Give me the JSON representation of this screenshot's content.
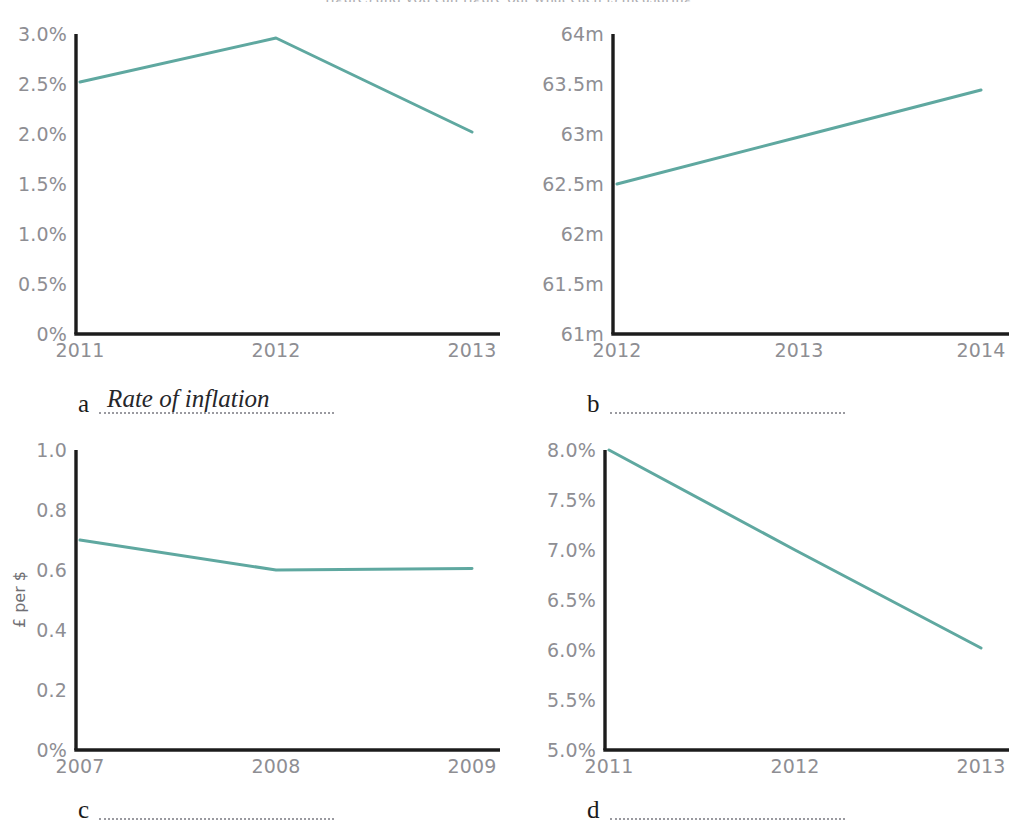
{
  "page": {
    "title_remnant": "figures and you can figure out what each is measuring",
    "line_color": "#5fa8a0",
    "axis_color": "#1c1c1c",
    "tick_label_color": "#8e8e93"
  },
  "charts": [
    {
      "key": "a",
      "letter": "a",
      "caption_answer": "Rate of inflation",
      "chart_data": {
        "type": "line",
        "title": "",
        "xlabel": "",
        "ylabel": "",
        "x": [
          "2011",
          "2012",
          "2013"
        ],
        "categories": [
          "2011",
          "2012",
          "2013"
        ],
        "values": [
          2.52,
          2.96,
          2.02
        ],
        "series": [
          {
            "name": "Rate of inflation",
            "values": [
              2.52,
              2.96,
              2.02
            ]
          }
        ],
        "ylim": [
          0,
          3.0
        ],
        "xticklabels": [
          "2011",
          "2012",
          "2013"
        ],
        "yticklabels": [
          "0%",
          "0.5%",
          "1.0%",
          "1.5%",
          "2.0%",
          "2.5%",
          "3.0%"
        ],
        "ytickvalues": [
          0,
          0.5,
          1.0,
          1.5,
          2.0,
          2.5,
          3.0
        ],
        "grid": false,
        "legend": false
      }
    },
    {
      "key": "b",
      "letter": "b",
      "caption_answer": "",
      "chart_data": {
        "type": "line",
        "title": "",
        "xlabel": "",
        "ylabel": "",
        "x": [
          "2012",
          "2013",
          "2014"
        ],
        "categories": [
          "2012",
          "2013",
          "2014"
        ],
        "values": [
          62.5,
          62.97,
          63.44
        ],
        "series": [
          {
            "name": "Population",
            "values": [
              62.5,
              62.97,
              63.44
            ]
          }
        ],
        "ylim": [
          61,
          64
        ],
        "xticklabels": [
          "2012",
          "2013",
          "2014"
        ],
        "yticklabels": [
          "61m",
          "61.5m",
          "62m",
          "62.5m",
          "63m",
          "63.5m",
          "64m"
        ],
        "ytickvalues": [
          61,
          61.5,
          62,
          62.5,
          63,
          63.5,
          64
        ],
        "grid": false,
        "legend": false
      }
    },
    {
      "key": "c",
      "letter": "c",
      "caption_answer": "",
      "chart_data": {
        "type": "line",
        "title": "",
        "xlabel": "",
        "ylabel": "£ per $",
        "x": [
          "2007",
          "2008",
          "2009"
        ],
        "categories": [
          "2007",
          "2008",
          "2009"
        ],
        "values": [
          0.7,
          0.6,
          0.605
        ],
        "series": [
          {
            "name": "Exchange rate",
            "values": [
              0.7,
              0.6,
              0.605
            ]
          }
        ],
        "ylim": [
          0,
          1.0
        ],
        "xticklabels": [
          "2007",
          "2008",
          "2009"
        ],
        "yticklabels": [
          "0%",
          "0.2",
          "0.4",
          "0.6",
          "0.8",
          "1.0"
        ],
        "ytickvalues": [
          0,
          0.2,
          0.4,
          0.6,
          0.8,
          1.0
        ],
        "grid": false,
        "legend": false
      }
    },
    {
      "key": "d",
      "letter": "d",
      "caption_answer": "",
      "chart_data": {
        "type": "line",
        "title": "",
        "xlabel": "",
        "ylabel": "",
        "x": [
          "2011",
          "2012",
          "2013"
        ],
        "categories": [
          "2011",
          "2012",
          "2013"
        ],
        "values": [
          8.0,
          7.0,
          6.02
        ],
        "series": [
          {
            "name": "Unemployment rate",
            "values": [
              8.0,
              7.0,
              6.02
            ]
          }
        ],
        "ylim": [
          5.0,
          8.0
        ],
        "xticklabels": [
          "2011",
          "2012",
          "2013"
        ],
        "yticklabels": [
          "5.0%",
          "5.5%",
          "6.0%",
          "6.5%",
          "7.0%",
          "7.5%",
          "8.0%"
        ],
        "ytickvalues": [
          5.0,
          5.5,
          6.0,
          6.5,
          7.0,
          7.5,
          8.0
        ],
        "grid": false,
        "legend": false
      }
    }
  ]
}
